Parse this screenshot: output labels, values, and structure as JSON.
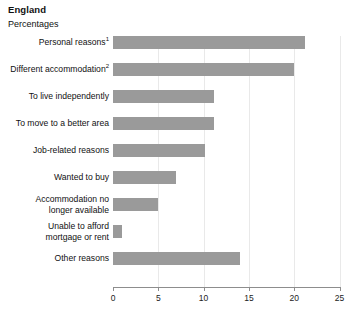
{
  "header": {
    "region_title": "England",
    "units_label": "Percentages"
  },
  "chart_data": {
    "type": "bar",
    "orientation": "horizontal",
    "title": "England",
    "subtitle": "Percentages",
    "xlabel": "",
    "ylabel": "",
    "xlim": [
      0,
      25
    ],
    "xticks": [
      0,
      5,
      10,
      15,
      20,
      25
    ],
    "xtick_labels": [
      "0",
      "5",
      "10",
      "15",
      "20",
      "25"
    ],
    "grid": true,
    "grid_axis": "x",
    "legend": false,
    "bar_color": "#9a9a9a",
    "gridline_color": "#e9e9e9",
    "axis_color": "#8d8d8d",
    "categories": [
      "Personal reasons",
      "Different  accommodation",
      "To live independently",
      "To move to a better area",
      "Job-related reasons",
      "Wanted to buy",
      "Accommodation no longer available",
      "Unable to afford mortgage or rent",
      "Other reasons"
    ],
    "category_footnotes": [
      "1",
      "2",
      "",
      "",
      "",
      "",
      "",
      "",
      ""
    ],
    "category_lines": [
      [
        "Personal reasons"
      ],
      [
        "Different  accommodation"
      ],
      [
        "To live independently"
      ],
      [
        "To move to a better area"
      ],
      [
        "Job-related reasons"
      ],
      [
        "Wanted to buy"
      ],
      [
        "Accommodation no",
        "longer available"
      ],
      [
        "Unable to afford",
        "mortgage or rent"
      ],
      [
        "Other reasons"
      ]
    ],
    "values": [
      21.2,
      20.0,
      11.2,
      11.2,
      10.2,
      7.0,
      5.0,
      1.0,
      14.0
    ]
  }
}
